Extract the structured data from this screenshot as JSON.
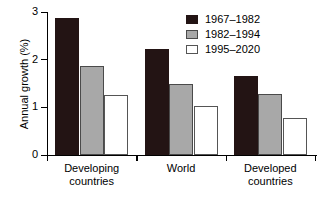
{
  "chart_data": {
    "type": "bar",
    "title": "",
    "xlabel": "",
    "ylabel": "Annual growth (%)",
    "ylim": [
      0,
      3
    ],
    "yticks": [
      "0",
      "1",
      "2",
      "3"
    ],
    "grid": false,
    "legend_position": "top-right",
    "categories": [
      "Developing countries",
      "World",
      "Developed countries"
    ],
    "category_lines": [
      [
        "Developing",
        "countries"
      ],
      [
        "World",
        ""
      ],
      [
        "Developed",
        "countries"
      ]
    ],
    "series": [
      {
        "name": "1967–1982",
        "color": "#231414",
        "values": [
          2.87,
          2.22,
          1.66
        ]
      },
      {
        "name": "1982–1994",
        "color": "#a8a8a8",
        "values": [
          1.87,
          1.49,
          1.28
        ]
      },
      {
        "name": "1995–2020",
        "color": "#ffffff",
        "values": [
          1.26,
          1.03,
          0.78
        ]
      }
    ]
  },
  "axis": {
    "y_label": "Annual growth (%)",
    "y_tick_0": "0",
    "y_tick_1": "1",
    "y_tick_2": "2",
    "y_tick_3": "3"
  },
  "legend": {
    "entries": [
      {
        "label": "1967–1982"
      },
      {
        "label": "1982–1994"
      },
      {
        "label": "1995–2020"
      }
    ]
  },
  "groups": [
    {
      "line1": "Developing",
      "line2": "countries"
    },
    {
      "line1": "World",
      "line2": ""
    },
    {
      "line1": "Developed",
      "line2": "countries"
    }
  ]
}
